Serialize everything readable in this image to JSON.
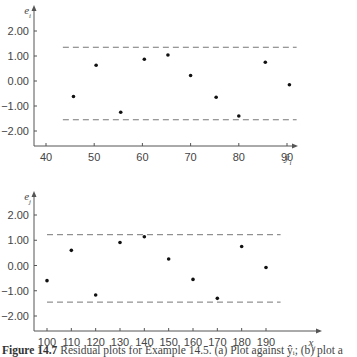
{
  "chart_data": [
    {
      "type": "scatter",
      "panel": "a",
      "title": "",
      "xlabel": "ŷ_i",
      "ylabel": "e_i",
      "xticks": [
        40,
        50,
        60,
        70,
        80,
        90
      ],
      "yticks": [
        2.0,
        1.0,
        0.0,
        -1.0,
        -2.0
      ],
      "ytick_labels": [
        "2.00",
        "1.00",
        "0.00",
        "−1.00",
        "−2.00"
      ],
      "xlim": [
        37.5,
        93
      ],
      "ylim": [
        -2.6,
        2.4
      ],
      "grid": false,
      "points": [
        {
          "x": 45.7,
          "y": -0.62
        },
        {
          "x": 50.4,
          "y": 0.63
        },
        {
          "x": 55.5,
          "y": -1.25
        },
        {
          "x": 60.4,
          "y": 0.87
        },
        {
          "x": 65.3,
          "y": 1.04
        },
        {
          "x": 70.0,
          "y": 0.22
        },
        {
          "x": 75.3,
          "y": -0.65
        },
        {
          "x": 80.0,
          "y": -1.4
        },
        {
          "x": 85.5,
          "y": 0.75
        },
        {
          "x": 90.5,
          "y": -0.15
        }
      ],
      "reference_lines": [
        {
          "y": 1.35,
          "style": "dashed",
          "x_from": 43.5,
          "x_to": 92
        },
        {
          "y": -1.55,
          "style": "dashed",
          "x_from": 43.5,
          "x_to": 92
        }
      ]
    },
    {
      "type": "scatter",
      "panel": "b",
      "title": "",
      "xlabel": "x_j",
      "ylabel": "e_j",
      "xticks": [
        100,
        110,
        120,
        130,
        140,
        150,
        160,
        170,
        180,
        190
      ],
      "yticks": [
        2.0,
        1.0,
        0.0,
        -1.0,
        -2.0
      ],
      "ytick_labels": [
        "2.00",
        "1.00",
        "0.00",
        "−1.00",
        "−2.00"
      ],
      "xlim": [
        94.5,
        217
      ],
      "ylim": [
        -2.6,
        2.6
      ],
      "grid": false,
      "points": [
        {
          "x": 100,
          "y": -0.6
        },
        {
          "x": 110,
          "y": 0.6
        },
        {
          "x": 120,
          "y": -1.17
        },
        {
          "x": 130,
          "y": 0.91
        },
        {
          "x": 140,
          "y": 1.14
        },
        {
          "x": 150,
          "y": 0.26
        },
        {
          "x": 160,
          "y": -0.55
        },
        {
          "x": 170,
          "y": -1.3
        },
        {
          "x": 180,
          "y": 0.75
        },
        {
          "x": 190,
          "y": -0.08
        }
      ],
      "reference_lines": [
        {
          "y": 1.22,
          "style": "dashed",
          "x_from": 100,
          "x_to": 196
        },
        {
          "y": -1.45,
          "style": "dashed",
          "x_from": 100,
          "x_to": 196
        }
      ]
    }
  ],
  "caption": {
    "label": "Figure 14.7",
    "text": "Residual plots for Example 14.5. (a) Plot against ŷᵢ; (b) plot a"
  }
}
